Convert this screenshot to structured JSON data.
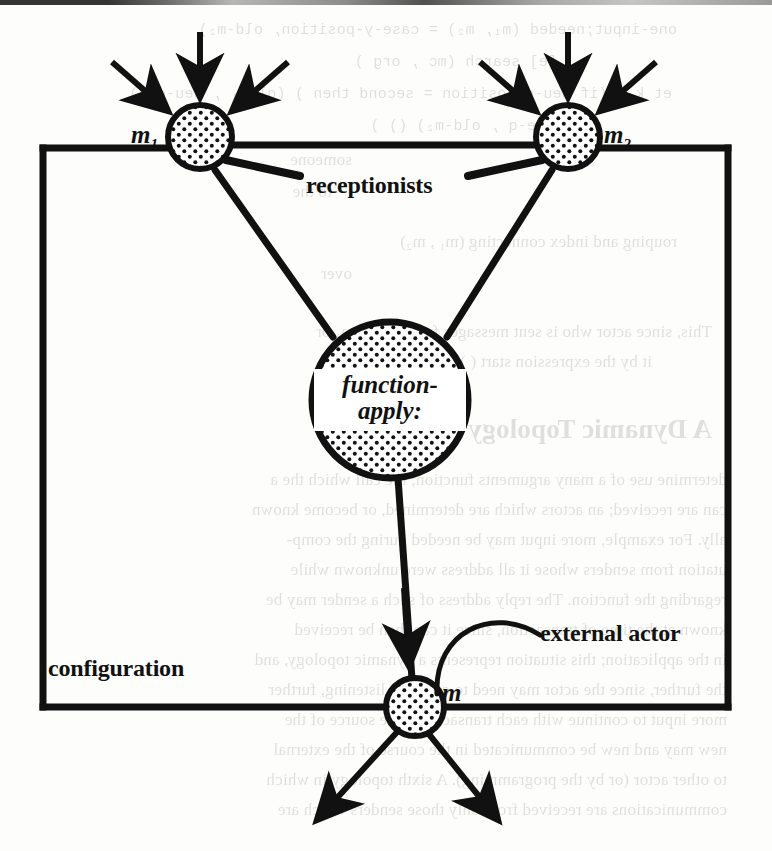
{
  "page": {
    "kind": "scanned-book-figure",
    "width": 772,
    "height": 851,
    "background_color": "#fdfdfb",
    "ink_color": "#111111"
  },
  "diagram": {
    "type": "actor-configuration-diagram",
    "boundary_label": "configuration",
    "nodes": [
      {
        "id": "m1",
        "label": "m",
        "subscript": "1",
        "role": "receptionist",
        "shape": "stippled-circle",
        "cx": 200,
        "cy": 137,
        "r": 32
      },
      {
        "id": "m2",
        "label": "m",
        "subscript": "2",
        "role": "receptionist",
        "shape": "stippled-circle",
        "cx": 568,
        "cy": 137,
        "r": 32
      },
      {
        "id": "fa",
        "label": "function-apply:",
        "role": "internal-actor",
        "shape": "stippled-circle",
        "cx": 390,
        "cy": 400,
        "r": 78
      },
      {
        "id": "m",
        "label": "m",
        "role": "external-actor",
        "shape": "stippled-circle",
        "cx": 415,
        "cy": 707,
        "r": 28
      }
    ],
    "node_labels": {
      "m1": "m",
      "m1_sub": "1",
      "m2": "m",
      "m2_sub": "2",
      "m": "m",
      "function_apply_line1": "function-",
      "function_apply_line2": "apply:"
    },
    "annotations": [
      {
        "id": "receptionists",
        "text": "receptionists",
        "points_to": [
          "m1",
          "m2"
        ],
        "style": "leader-lines"
      },
      {
        "id": "external-actor",
        "text": "external actor",
        "points_to": [
          "m"
        ],
        "style": "curved-leader"
      },
      {
        "id": "configuration",
        "text": "configuration",
        "points_to": [
          "boundary-box"
        ],
        "style": "plain"
      }
    ],
    "edges": [
      {
        "from": "m1",
        "to": "fa",
        "kind": "link"
      },
      {
        "from": "m2",
        "to": "fa",
        "kind": "link"
      },
      {
        "from": "fa",
        "to": "m",
        "kind": "link"
      }
    ],
    "incoming_arrows": {
      "m1": 3,
      "m2": 3
    },
    "outgoing_arrows": {
      "m": 2
    }
  },
  "bleed_through": {
    "note": "mirrored text visible from the reverse side of the scanned page",
    "lines": [
      "one-input;needed (m₁, m₂) = case-y-position, old-m₂)",
      "[e] search (mc , org )",
      "et k = (if neu-n-position = second then ) (oldm₁ , neu-org)",
      "(neu-e-q , old-m₂) () )",
      "someone",
      "to the",
      "rouping and index connecting (m₁ , m₂)",
      "over",
      "This, since actor who is sent messages from actors m₁ or",
      "it by the expression start ( ) (a , sc , org) ( , m₁).",
      "A Dynamic Topology",
      "determine use of a many arguments function; the call which the a",
      "can are received; an actors which are determined, or become known",
      "ally. For example, more input may be needed during the comp-",
      "utation from senders whose it all address were unknown while",
      "regarding the function. The reply address of such a sender may be",
      "known at the time of transaction, since it can then be received",
      "in the application; this situation represents a dynamic topology, and",
      "the further, since the actor may need to continue listening, further",
      "more input to continue with each transaction. The source of the",
      "new may and new be communicated in the course of the external",
      "to other actor (or by the programming). A sixth topology in which",
      "communications are received from only those senders which are"
    ]
  }
}
